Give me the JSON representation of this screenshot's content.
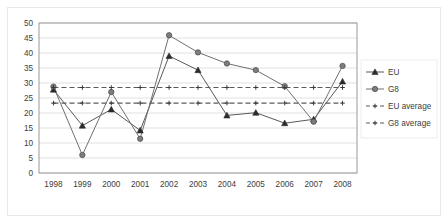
{
  "chart_data": {
    "type": "line",
    "title": "",
    "subtitle": "",
    "xlabel": "",
    "ylabel": "",
    "categories": [
      "1998",
      "1999",
      "2000",
      "2001",
      "2002",
      "2003",
      "2004",
      "2005",
      "2006",
      "2007",
      "2008"
    ],
    "ylim": [
      0,
      50
    ],
    "yticks": [
      "0",
      "5",
      "10",
      "15",
      "20",
      "25",
      "30",
      "35",
      "40",
      "45",
      "50"
    ],
    "ytick_values": [
      0,
      5,
      10,
      15,
      20,
      25,
      30,
      35,
      40,
      45,
      50
    ],
    "grid": true,
    "grid_axis": "y",
    "legend_position": "right",
    "series": [
      {
        "name": "EU",
        "marker": "triangle",
        "style": "solid",
        "color": "#595959",
        "values": [
          27.8,
          15.8,
          21.2,
          14.2,
          39.0,
          34.3,
          19.2,
          20.1,
          16.6,
          17.9,
          30.5
        ]
      },
      {
        "name": "G8",
        "marker": "circle",
        "style": "solid",
        "color": "#707070",
        "values": [
          28.8,
          6.0,
          27.0,
          11.4,
          45.9,
          40.2,
          36.5,
          34.3,
          28.9,
          17.1,
          35.7
        ]
      },
      {
        "name": "EU average",
        "marker": "plus",
        "style": "dashed",
        "color": "#5a5a5a",
        "constant": 23.3,
        "values": [
          23.3,
          23.3,
          23.3,
          23.3,
          23.3,
          23.3,
          23.3,
          23.3,
          23.3,
          23.3,
          23.3
        ]
      },
      {
        "name": "G8 average",
        "marker": "plus",
        "style": "dashed",
        "color": "#5a5a5a",
        "constant": 28.5,
        "values": [
          28.5,
          28.5,
          28.5,
          28.5,
          28.5,
          28.5,
          28.5,
          28.5,
          28.5,
          28.5,
          28.5
        ]
      }
    ]
  },
  "legend": {
    "items": [
      {
        "label": "EU"
      },
      {
        "label": "G8"
      },
      {
        "label": "EU average"
      },
      {
        "label": "G8 average"
      }
    ]
  },
  "colors": {
    "plot_border": "#9a9a9a",
    "grid": "#d9d9d9",
    "frame": "#e8e8e8",
    "text": "#404040",
    "background": "#ffffff"
  }
}
